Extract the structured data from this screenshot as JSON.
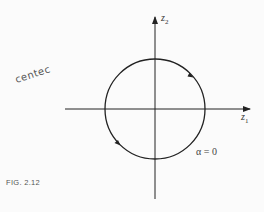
{
  "figure": {
    "caption": "FIG. 2.12",
    "annotation": "centec",
    "x_axis": {
      "label": "z",
      "sub": "1"
    },
    "y_axis": {
      "label": "z",
      "sub": "2"
    },
    "parameter_label": "α = 0",
    "curve": {
      "type": "circle",
      "direction": "counterclockwise",
      "stroke": "#222222"
    }
  }
}
